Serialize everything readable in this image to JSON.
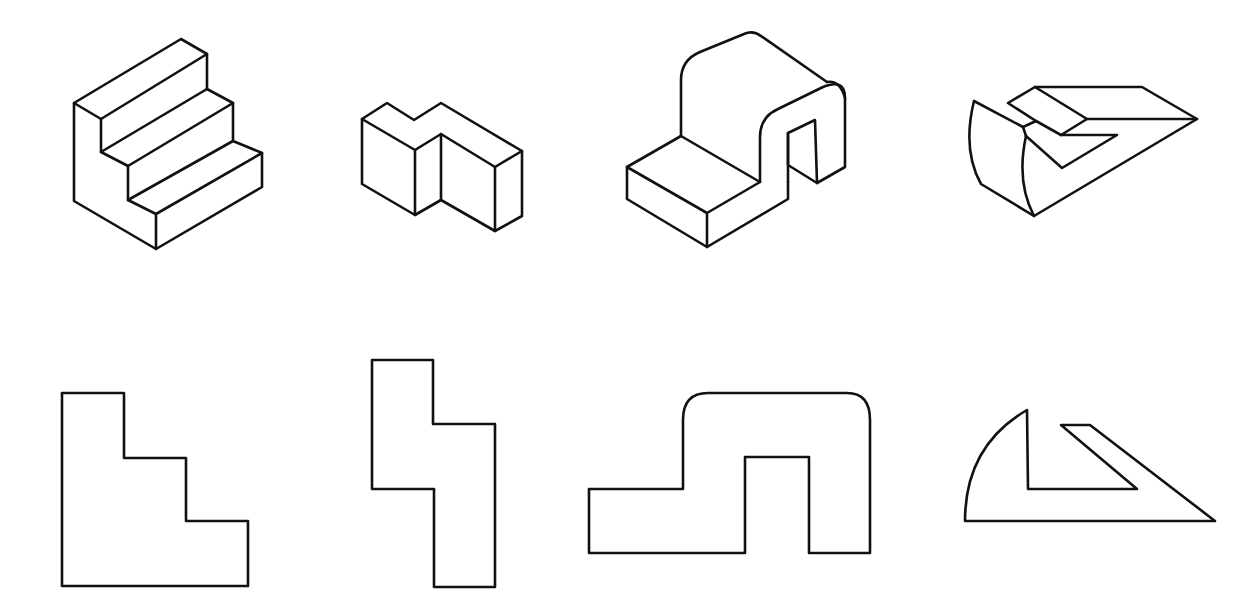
{
  "diagram": {
    "title": "",
    "stroke_color": "#111111",
    "background": "#ffffff",
    "rows": [
      {
        "name": "isometric-views",
        "figures": [
          {
            "id": "stair-block-isometric",
            "description": "Three-step staircase solid, isometric view"
          },
          {
            "id": "offset-block-isometric",
            "description": "Z-offset stepped block, isometric view"
          },
          {
            "id": "arch-block-isometric",
            "description": "Block with rounded arch and slot, isometric view"
          },
          {
            "id": "wedge-block-isometric",
            "description": "Curved wedge with L-notch, isometric view"
          }
        ]
      },
      {
        "name": "orthographic-views",
        "figures": [
          {
            "id": "stair-profile",
            "description": "Stair profile outline"
          },
          {
            "id": "offset-profile",
            "description": "Z-offset profile outline"
          },
          {
            "id": "arch-profile",
            "description": "Arch with slot profile outline"
          },
          {
            "id": "wedge-profile",
            "description": "Curved wedge with notch profile outline"
          }
        ]
      }
    ]
  }
}
